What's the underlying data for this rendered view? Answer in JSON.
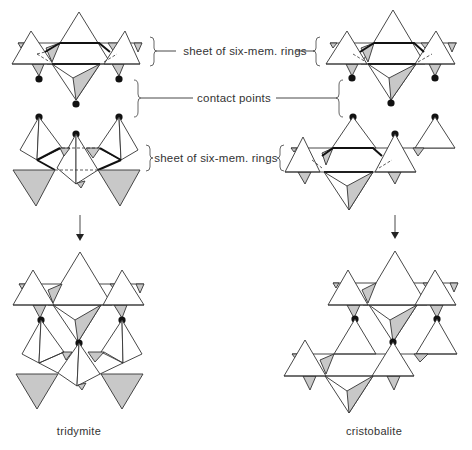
{
  "diagram": {
    "title_labels": {
      "top_sheet": "sheet of six-mem. rings",
      "contact": "contact points",
      "bottom_sheet": "sheet of six-mem. rings"
    },
    "structures": [
      {
        "name": "tridymite",
        "caption": "tridymite"
      },
      {
        "name": "cristobalite",
        "caption": "cristobalite"
      }
    ],
    "colors": {
      "line": "#333333",
      "shaded_face": "#c8c8c8",
      "contact_point": "#111111",
      "background": "#ffffff"
    }
  }
}
